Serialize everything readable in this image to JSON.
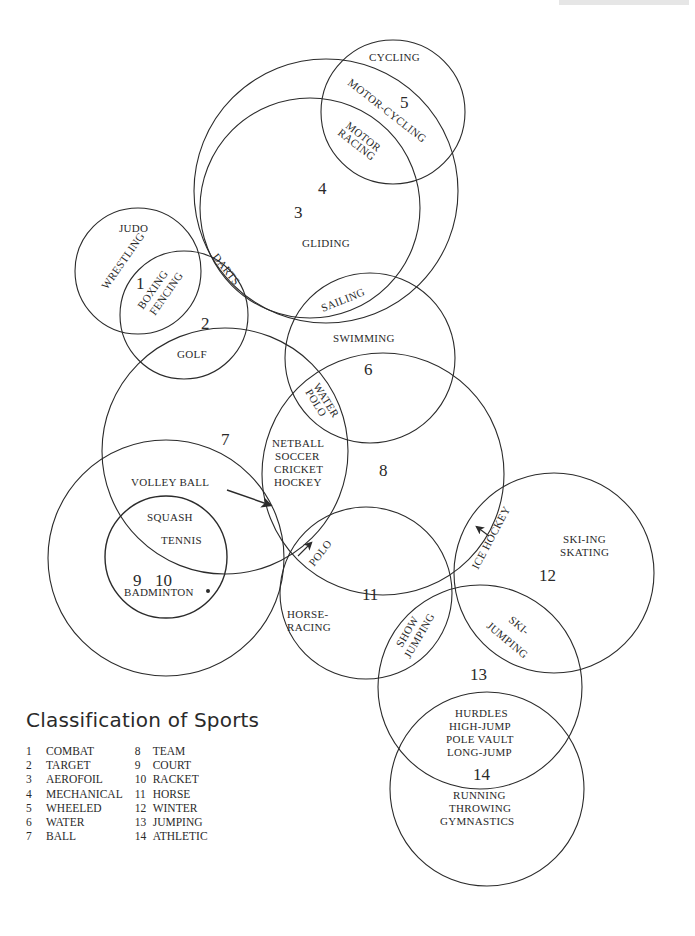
{
  "title": "Classification of Sports",
  "legend": [
    {
      "num": "1",
      "label": "COMBAT"
    },
    {
      "num": "2",
      "label": "TARGET"
    },
    {
      "num": "3",
      "label": "AEROFOIL"
    },
    {
      "num": "4",
      "label": "MECHANICAL"
    },
    {
      "num": "5",
      "label": "WHEELED"
    },
    {
      "num": "6",
      "label": "WATER"
    },
    {
      "num": "7",
      "label": "BALL"
    },
    {
      "num": "8",
      "label": "TEAM"
    },
    {
      "num": "9",
      "label": "COURT"
    },
    {
      "num": "10",
      "label": "RACKET"
    },
    {
      "num": "11",
      "label": "HORSE"
    },
    {
      "num": "12",
      "label": "WINTER"
    },
    {
      "num": "13",
      "label": "JUMPING"
    },
    {
      "num": "14",
      "label": "ATHLETIC"
    }
  ],
  "circles": [
    {
      "id": "1",
      "category": "COMBAT",
      "cx": 138,
      "cy": 271,
      "r": 63
    },
    {
      "id": "2",
      "category": "TARGET",
      "cx": 184,
      "cy": 315,
      "r": 64
    },
    {
      "id": "3",
      "category": "AEROFOIL",
      "cx": 310,
      "cy": 208,
      "r": 110
    },
    {
      "id": "4",
      "category": "MECHANICAL",
      "cx": 326,
      "cy": 191,
      "r": 132
    },
    {
      "id": "5",
      "category": "WHEELED",
      "cx": 393,
      "cy": 112,
      "r": 72
    },
    {
      "id": "6",
      "category": "WATER",
      "cx": 370,
      "cy": 358,
      "r": 85
    },
    {
      "id": "7",
      "category": "BALL",
      "cx": 225,
      "cy": 451,
      "r": 123
    },
    {
      "id": "8",
      "category": "TEAM",
      "cx": 383,
      "cy": 474,
      "r": 121
    },
    {
      "id": "9",
      "category": "COURT",
      "cx": 166,
      "cy": 558,
      "r": 118
    },
    {
      "id": "10",
      "category": "RACKET",
      "cx": 166,
      "cy": 557,
      "r": 61
    },
    {
      "id": "11",
      "category": "HORSE",
      "cx": 366,
      "cy": 593,
      "r": 86
    },
    {
      "id": "12",
      "category": "WINTER",
      "cx": 554,
      "cy": 573,
      "r": 100
    },
    {
      "id": "13",
      "category": "JUMPING",
      "cx": 480,
      "cy": 687,
      "r": 102
    },
    {
      "id": "14",
      "category": "ATHLETIC",
      "cx": 487,
      "cy": 789,
      "r": 97
    }
  ],
  "numbers": {
    "n1": "1",
    "n2": "2",
    "n3": "3",
    "n4": "4",
    "n5": "5",
    "n6": "6",
    "n7": "7",
    "n8": "8",
    "n9": "9",
    "n10": "10",
    "n11": "11",
    "n12": "12",
    "n13": "13",
    "n14": "14"
  },
  "sports": {
    "cycling": "CYCLING",
    "motor_cycling": "MOTOR-CYCLING",
    "motor": "MOTOR",
    "racing": "RACING",
    "gliding": "GLIDING",
    "judo": "JUDO",
    "wrestling": "WRESTLING",
    "boxing": "BOXING",
    "fencing": "FENCING",
    "darts": "DARTS",
    "golf": "GOLF",
    "sailing": "SAILING",
    "swimming": "SWIMMING",
    "water": "WATER",
    "polo_water": "POLO",
    "netball": "NETBALL",
    "soccer": "SOCCER",
    "cricket": "CRICKET",
    "hockey": "HOCKEY",
    "volleyball": "VOLLEY BALL",
    "squash": "SQUASH",
    "tennis": "TENNIS",
    "badminton": "BADMINTON",
    "polo": "POLO",
    "horse": "HORSE-",
    "horse_racing": "RACING",
    "ice_hockey": "ICE HOCKEY",
    "skiing": "SKI-ING",
    "skating": "SKATING",
    "show": "SHOW",
    "show_jumping": "JUMPING",
    "ski": "SKI-",
    "ski_jumping": "JUMPING",
    "hurdles": "HURDLES",
    "high_jump": "HIGH-JUMP",
    "pole_vault": "POLE VAULT",
    "long_jump": "LONG-JUMP",
    "running": "RUNNING",
    "throwing": "THROWING",
    "gymnastics": "GYMNASTICS"
  }
}
